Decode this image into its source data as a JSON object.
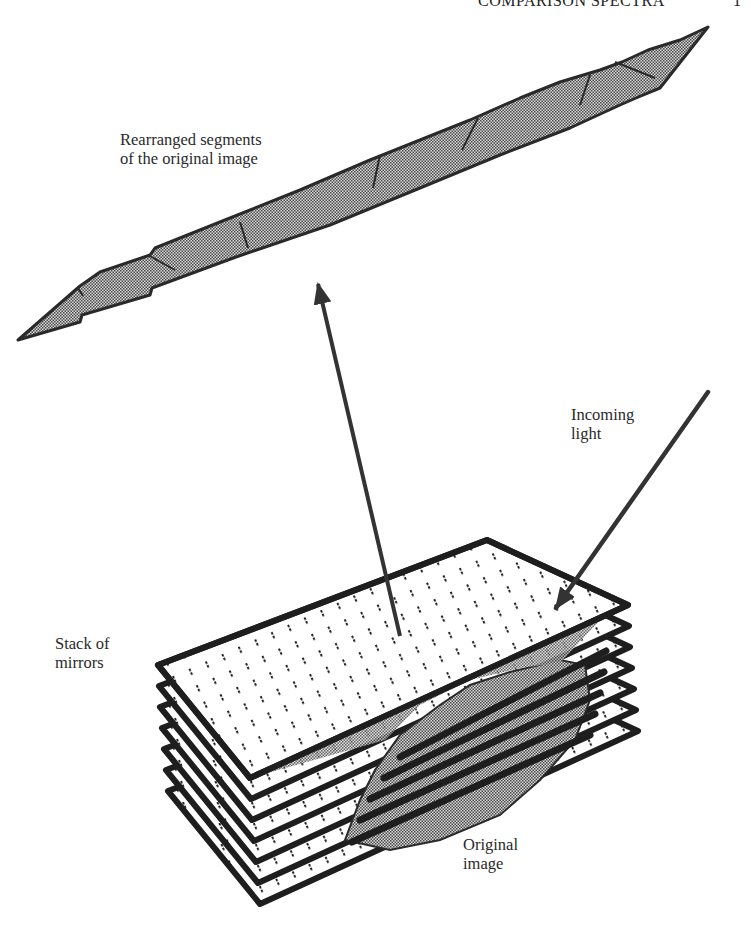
{
  "page_header": {
    "running_title": "COMPARISON SPECTRA",
    "page_number": "1"
  },
  "labels": {
    "rearranged": [
      "Rearranged segments",
      "of the original image"
    ],
    "incoming": [
      "Incoming",
      "light"
    ],
    "stack": [
      "Stack of",
      "mirrors"
    ],
    "original": [
      "Original",
      "image"
    ]
  },
  "diagram": {
    "mirror_count": 7,
    "mirror_offset_px": 21,
    "colors": {
      "ink": "#1e1e1e",
      "arrow": "#333333",
      "image_fill": "#7a7a7a",
      "mirror_fill": "#ffffff"
    }
  }
}
